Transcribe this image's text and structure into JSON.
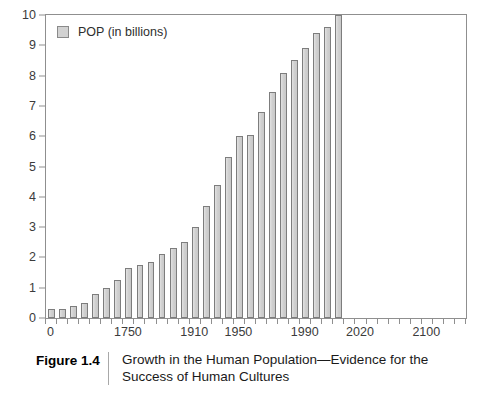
{
  "figure": {
    "number_label": "Figure 1.4",
    "caption": "Growth in the Human Population—Evidence for the Success of Human Cultures"
  },
  "legend": {
    "label": "POP (in billions)",
    "swatch_color": "#d2d2d2",
    "swatch_border_color": "#8a8a8a"
  },
  "chart_data": {
    "type": "bar",
    "title": "Growth in the Human Population—Evidence for the Success of Human Cultures",
    "xlabel": "",
    "ylabel": "",
    "ylim": [
      0,
      10
    ],
    "y_ticks": [
      0,
      1,
      2,
      3,
      4,
      5,
      6,
      7,
      8,
      9,
      10
    ],
    "y_tick_labels": [
      "0",
      "1",
      "2",
      "3",
      "4",
      "5",
      "6",
      "7",
      "8",
      "9",
      "10"
    ],
    "x_tick_labels": [
      "0",
      "1750",
      "1910",
      "1950",
      "1990",
      "2020",
      "2100"
    ],
    "x_tick_label_indices": [
      0,
      7,
      13,
      17,
      23,
      28,
      34
    ],
    "grid": false,
    "legend_position": "upper-left",
    "series": [
      {
        "name": "POP (in billions)",
        "unit": "billions",
        "color": "#d2d2d2",
        "categories": [
          "0",
          "250",
          "500",
          "750",
          "1000",
          "1250",
          "1500",
          "1750",
          "1800",
          "1850",
          "1870",
          "1890",
          "1910",
          "1920",
          "1930",
          "1940",
          "1950",
          "1960",
          "1970",
          "1980",
          "1990",
          "1995",
          "2000",
          "2005",
          "2010",
          "2015",
          "2020",
          "2030",
          "2040",
          "2050",
          "2060",
          "2070",
          "2080",
          "2090",
          "2100",
          "2110",
          "2120",
          "2130"
        ],
        "values": [
          0.3,
          0.3,
          0.4,
          0.5,
          0.8,
          1.0,
          1.25,
          1.65,
          1.75,
          1.85,
          2.1,
          2.3,
          2.5,
          3.0,
          3.7,
          4.4,
          5.3,
          6.0,
          6.05,
          6.8,
          7.45,
          8.1,
          8.5,
          8.9,
          9.4,
          9.6,
          10.0,
          0,
          0,
          0,
          0,
          0,
          0,
          0,
          0,
          0,
          0,
          0
        ]
      }
    ]
  },
  "axis": {
    "frame_color": "#8f8f8f",
    "tick_color": "#8f8f8f",
    "label_color": "#3b3b3b"
  }
}
